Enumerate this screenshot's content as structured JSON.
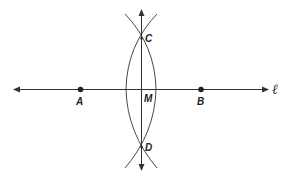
{
  "diagram": {
    "line_label": "ℓ",
    "points": {
      "A": {
        "label": "A"
      },
      "B": {
        "label": "B"
      },
      "C": {
        "label": "C"
      },
      "D": {
        "label": "D"
      },
      "M": {
        "label": "M"
      }
    },
    "colors": {
      "stroke": "#333333",
      "background": "#ffffff"
    }
  }
}
